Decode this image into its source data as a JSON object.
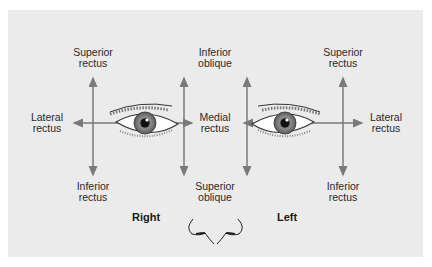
{
  "diagram": {
    "colors": {
      "background": "#ebebeb",
      "arrow": "#7a7a7a",
      "text": "#2a2a2a"
    },
    "right_eye": {
      "side_label": "Right",
      "superior": [
        "Superior",
        "rectus"
      ],
      "inferior": [
        "Inferior",
        "rectus"
      ],
      "lateral": [
        "Lateral",
        "rectus"
      ]
    },
    "center": {
      "top": [
        "Inferior",
        "oblique"
      ],
      "middle": [
        "Medial",
        "rectus"
      ],
      "bottom": [
        "Superior",
        "oblique"
      ]
    },
    "left_eye": {
      "side_label": "Left",
      "superior": [
        "Superior",
        "rectus"
      ],
      "inferior": [
        "Inferior",
        "rectus"
      ],
      "lateral": [
        "Lateral",
        "rectus"
      ]
    }
  }
}
